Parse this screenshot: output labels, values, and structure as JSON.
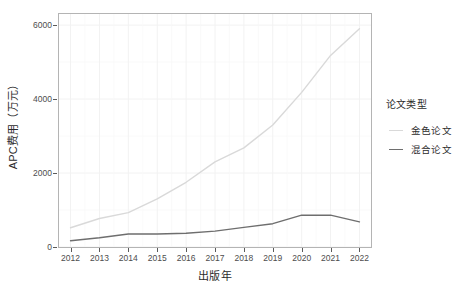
{
  "chart_data": {
    "type": "line",
    "title": "",
    "xlabel": "出版年",
    "ylabel": "APC费用（万元）",
    "x": [
      2012,
      2013,
      2014,
      2015,
      2016,
      2017,
      2018,
      2019,
      2020,
      2021,
      2022
    ],
    "xticklabels": [
      "2012",
      "2013",
      "2014",
      "2015",
      "2016",
      "2017",
      "2018",
      "2019",
      "2020",
      "2021",
      "2022"
    ],
    "yticklabels": [
      "0",
      "2000",
      "4000",
      "6000"
    ],
    "yticks": [
      0,
      2000,
      4000,
      6000
    ],
    "ylim": [
      0,
      6300
    ],
    "xlim": [
      2011.6,
      2022.4
    ],
    "grid": true,
    "legend_position": "right",
    "legend_title": "论文类型",
    "series": [
      {
        "name": "金色论文",
        "color": "#d9d9d9",
        "values": [
          520,
          770,
          930,
          1300,
          1750,
          2300,
          2680,
          3300,
          4180,
          5180,
          5900
        ]
      },
      {
        "name": "混合论文",
        "color": "#6e6e6e",
        "values": [
          170,
          250,
          350,
          350,
          370,
          430,
          530,
          630,
          860,
          860,
          680
        ]
      }
    ]
  },
  "legend": {
    "title": "论文类型",
    "items": [
      {
        "label": "金色论文",
        "color": "#d9d9d9"
      },
      {
        "label": "混合论文",
        "color": "#6e6e6e"
      }
    ]
  },
  "axes": {
    "x_title": "出版年",
    "y_title": "APC费用（万元）",
    "x_tick_labels": [
      "2012",
      "2013",
      "2014",
      "2015",
      "2016",
      "2017",
      "2018",
      "2019",
      "2020",
      "2021",
      "2022"
    ],
    "y_tick_labels": [
      "0",
      "2000",
      "4000",
      "6000"
    ]
  },
  "colors": {
    "panel_border": "#b4b4b4",
    "grid_major": "#f2f2f2",
    "grid_minor": "#f8f8f8",
    "text": "#2b2b2b",
    "tick_text": "#4d4d4d",
    "background": "#ffffff"
  }
}
